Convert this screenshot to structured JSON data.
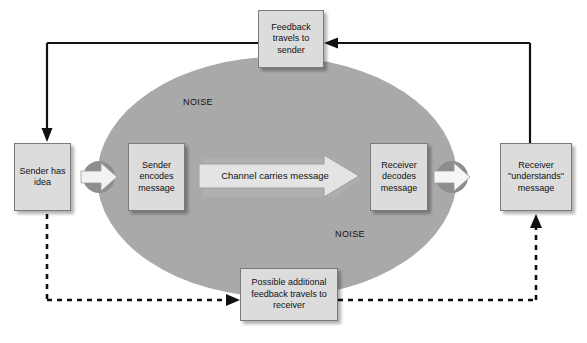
{
  "diagram": {
    "colors": {
      "noise_ellipse": "#a9a9a9",
      "box_fill": "#dcdcdc",
      "box_border": "#7a7a7a",
      "line": "#111111",
      "channel_arrow_fill": "#e4e4e4",
      "chevron_fill": "#f2f2f2",
      "chevron_circle": "#8d8d8d"
    },
    "noise_labels": {
      "top": "NOISE",
      "bottom": "NOISE"
    },
    "boxes": {
      "sender_idea": "Sender has idea",
      "sender_encodes": "Sender encodes message",
      "receiver_decodes": "Receiver decodes message",
      "receiver_understands": "Receiver \"understands\" message",
      "feedback_to_sender": "Feedback travels to sender",
      "feedback_to_receiver": "Possible additional feedback travels to receiver"
    },
    "channel": {
      "label": "Channel carries message"
    },
    "flows": {
      "forward_primary": "solid block arrows left to right through the noise ellipse",
      "feedback_upper": "solid line from receiver understands up and across to sender has idea, via feedback travels to sender",
      "feedback_lower": "dashed line from sender has idea down and across to receiver understands, via possible additional feedback travels to receiver"
    }
  }
}
